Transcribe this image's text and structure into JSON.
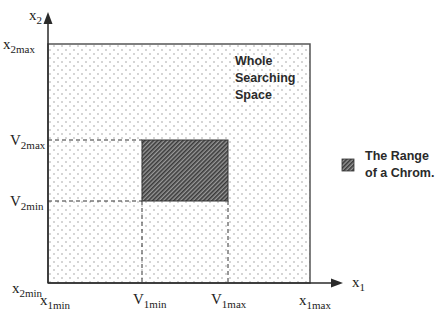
{
  "diagram": {
    "axes": {
      "x_axis": {
        "symbol": "x",
        "sub": "1"
      },
      "y_axis": {
        "symbol": "x",
        "sub": "2"
      }
    },
    "y_ticks": [
      {
        "symbol": "x",
        "sub": "2max"
      },
      {
        "symbol": "V",
        "sub": "2max"
      },
      {
        "symbol": "V",
        "sub": "2min"
      },
      {
        "symbol": "x",
        "sub": "2min"
      }
    ],
    "x_ticks": [
      {
        "symbol": "x",
        "sub": "1min"
      },
      {
        "symbol": "V",
        "sub": "1min"
      },
      {
        "symbol": "V",
        "sub": "1max"
      },
      {
        "symbol": "x",
        "sub": "1max"
      }
    ],
    "whole_space_label": [
      "Whole",
      "Searching",
      "Space"
    ],
    "legend": {
      "label_line1": "The Range",
      "label_line2": "of a Chrom."
    },
    "colors": {
      "axis": "#2a2a2a",
      "box_border": "#555555",
      "dots": "#8a8a8a",
      "hatch_dark": "#3a3a3a",
      "hatch_light": "#9a9a9a"
    }
  }
}
